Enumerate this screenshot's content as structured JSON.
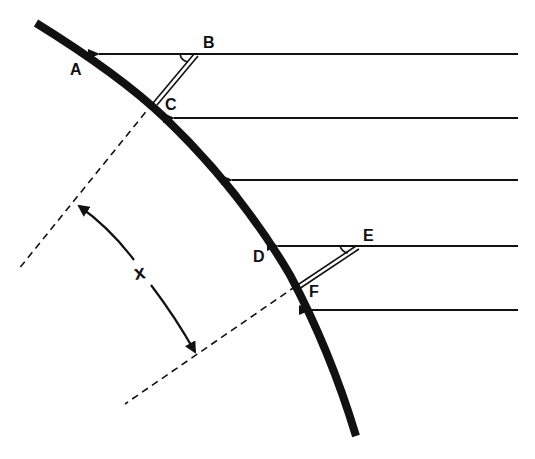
{
  "diagram": {
    "type": "geometry",
    "colors": {
      "ink": "#111111",
      "background": "#ffffff"
    },
    "points": [
      {
        "id": "A",
        "label": "A"
      },
      {
        "id": "B",
        "label": "B"
      },
      {
        "id": "C",
        "label": "C"
      },
      {
        "id": "D",
        "label": "D"
      },
      {
        "id": "E",
        "label": "E"
      },
      {
        "id": "F",
        "label": "F"
      }
    ],
    "distance_label": "x",
    "rays": [
      {
        "y": 54,
        "from_x": 518,
        "to_x": 97
      },
      {
        "y": 118,
        "from_x": 518,
        "to_x": 172
      },
      {
        "y": 180,
        "from_x": 518,
        "to_x": 230
      },
      {
        "y": 246,
        "from_x": 518,
        "to_x": 276
      },
      {
        "y": 310,
        "from_x": 518,
        "to_x": 308
      }
    ]
  }
}
